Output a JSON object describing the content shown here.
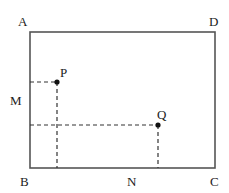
{
  "diagram": {
    "type": "geometry-rectangle",
    "colors": {
      "line": "#555555",
      "dash": "#333333",
      "point": "#111111",
      "text": "#222222"
    },
    "rectangle": {
      "corners": {
        "A": {
          "label": "A",
          "x": 30,
          "y": 32
        },
        "D": {
          "label": "D",
          "x": 215,
          "y": 32
        },
        "B": {
          "label": "B",
          "x": 30,
          "y": 168
        },
        "C": {
          "label": "C",
          "x": 215,
          "y": 168
        }
      }
    },
    "points": {
      "P": {
        "label": "P",
        "x": 57,
        "y": 82
      },
      "Q": {
        "label": "Q",
        "x": 158,
        "y": 125
      }
    },
    "side_labels": {
      "M": {
        "label": "M",
        "on_side": "AB"
      },
      "N": {
        "label": "N",
        "on_side": "BC"
      }
    },
    "labels": {
      "A": "A",
      "D": "D",
      "B": "B",
      "C": "C",
      "M": "M",
      "N": "N",
      "P": "P",
      "Q": "Q"
    }
  }
}
